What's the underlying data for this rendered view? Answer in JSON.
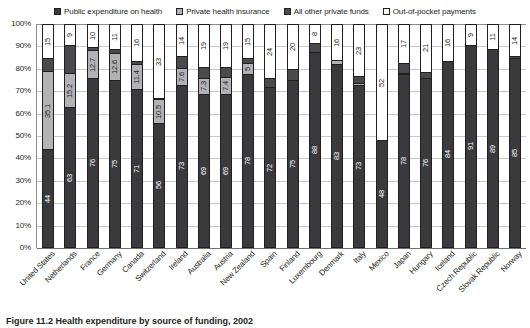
{
  "chart_data": {
    "type": "bar",
    "subtype": "stacked-bar-100",
    "title": "",
    "xlabel": "",
    "ylabel": "",
    "ylim": [
      0,
      100
    ],
    "yticks": [
      "0%",
      "10%",
      "20%",
      "30%",
      "40%",
      "50%",
      "60%",
      "70%",
      "80%",
      "90%",
      "100%"
    ],
    "grid": true,
    "legend_position": "top-center",
    "legend": [
      "Public expenditure on health",
      "Private health insurance",
      "All other private funds",
      "Out-of-pocket payments"
    ],
    "colors": {
      "public": "#3a3a3d",
      "private_insurance": "#b3b3b6",
      "other_private": "#4a4a4d",
      "out_of_pocket": "#ffffff",
      "axis": "#231f20",
      "gridline": "#c9c9cc"
    },
    "categories": [
      "United States",
      "Netherlands",
      "France",
      "Germany",
      "Canada",
      "Switzerland",
      "Ireland",
      "Australia",
      "Austria",
      "New Zealand",
      "Spain",
      "Finland",
      "Luxembourg",
      "Denmark",
      "Italy",
      "Mexico",
      "Japan",
      "Hungary",
      "Iceland",
      "Czech Republic",
      "Slovak Republic",
      "Norway"
    ],
    "series": [
      {
        "name": "Public expenditure on health",
        "values": [
          44,
          63,
          76,
          75,
          71,
          56,
          73,
          69,
          69,
          78,
          72,
          75,
          88,
          83,
          73,
          48,
          78,
          76,
          84,
          91,
          89,
          85
        ],
        "labels": [
          "44",
          "63",
          "76",
          "75",
          "71",
          "56",
          "73",
          "69",
          "69",
          "78",
          "72",
          "75",
          "88",
          "83",
          "73",
          "48",
          "78",
          "76",
          "84",
          "91",
          "89",
          "85"
        ]
      },
      {
        "name": "Private health insurance",
        "values": [
          35.1,
          15.2,
          12.7,
          12.6,
          11.4,
          10.5,
          7.6,
          7.3,
          7.4,
          5,
          0,
          0,
          0,
          1.5,
          1,
          0,
          0.3,
          0,
          0,
          0,
          0,
          0
        ],
        "labels": [
          "35.1",
          "15.2",
          "12.7",
          "12.6",
          "11.4",
          "10.5",
          "7.6",
          "7.3",
          "7.4",
          "5",
          "",
          "",
          "",
          "",
          "",
          "",
          "",
          "",
          "",
          "",
          "",
          ""
        ]
      },
      {
        "name": "All other private funds",
        "values": [
          5.9,
          12.8,
          1.3,
          1.4,
          1.6,
          0.5,
          5.4,
          4.7,
          4.6,
          2,
          4,
          5,
          4,
          0,
          3,
          0,
          4.7,
          3,
          0,
          0,
          0,
          1
        ],
        "labels": [
          "",
          "",
          "",
          "",
          "",
          "",
          "",
          "",
          "",
          "",
          "",
          "",
          "",
          "",
          "",
          "",
          "",
          "",
          "",
          "",
          "",
          ""
        ]
      },
      {
        "name": "Out-of-pocket payments",
        "values": [
          15,
          9,
          10,
          11,
          16,
          33,
          14,
          19,
          19,
          15,
          24,
          20,
          8,
          16,
          23,
          52,
          17,
          21,
          16,
          9,
          11,
          14
        ],
        "labels": [
          "15",
          "9",
          "10",
          "11",
          "16",
          "33",
          "14",
          "19",
          "19",
          "15",
          "24",
          "20",
          "8",
          "16",
          "23",
          "52",
          "17",
          "21",
          "16",
          "9",
          "11",
          "14"
        ]
      }
    ]
  },
  "caption": {
    "label": "Figure 11.2",
    "text": "Health expenditure by source of funding, 2002"
  }
}
